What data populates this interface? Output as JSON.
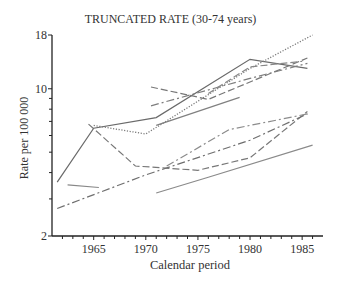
{
  "chart_data": {
    "type": "line",
    "title": "TRUNCATED RATE (30-74 years)",
    "xlabel": "Calendar period",
    "ylabel": "Rate per 100 000",
    "yscale": "log",
    "ylim": [
      2,
      18
    ],
    "xlim": [
      1961,
      1987
    ],
    "y_tick_labels": [
      "2",
      "10",
      "18"
    ],
    "y_minor_ticks": [
      3,
      4,
      5,
      6,
      7,
      8,
      9
    ],
    "x_tick_labels": [
      "1965",
      "1970",
      "1975",
      "1980",
      "1985"
    ],
    "grid": false,
    "legend": null,
    "series": [
      {
        "name": "solid-dark",
        "style": "solid",
        "x": [
          1961.5,
          1965,
          1971,
          1980,
          1985.5
        ],
        "y": [
          3.6,
          6.5,
          7.3,
          13.8,
          12.5
        ]
      },
      {
        "name": "dotted",
        "style": "dotted",
        "x": [
          1965,
          1970,
          1980,
          1986
        ],
        "y": [
          6.7,
          6.1,
          12.5,
          18.0
        ]
      },
      {
        "name": "long-dash",
        "style": "dashed",
        "x": [
          1964.5,
          1969,
          1975,
          1980,
          1985.5
        ],
        "y": [
          6.8,
          4.3,
          4.1,
          4.7,
          7.8
        ]
      },
      {
        "name": "dash-dot-lower",
        "style": "dashdot",
        "x": [
          1961.5,
          1970,
          1980,
          1985.5
        ],
        "y": [
          2.7,
          3.9,
          5.7,
          7.6
        ]
      },
      {
        "name": "solid-short-1962",
        "style": "solid",
        "x": [
          1962.5,
          1965.5
        ],
        "y": [
          3.5,
          3.4
        ]
      },
      {
        "name": "solid-lower-right",
        "style": "solid",
        "x": [
          1971,
          1976,
          1986
        ],
        "y": [
          3.2,
          3.8,
          5.4
        ]
      },
      {
        "name": "dash-dot-mid",
        "style": "dashdot",
        "x": [
          1972,
          1978,
          1985.5
        ],
        "y": [
          4.3,
          6.4,
          7.6
        ]
      },
      {
        "name": "dashed-upper-right",
        "style": "dashed",
        "x": [
          1970.5,
          1976,
          1985.5
        ],
        "y": [
          10.2,
          8.9,
          14.0
        ]
      },
      {
        "name": "long-dash-dot-upper",
        "style": "dashdot",
        "x": [
          1970.5,
          1980,
          1985.5
        ],
        "y": [
          8.3,
          11.2,
          13.2
        ]
      },
      {
        "name": "solid-upper-mid",
        "style": "solid",
        "x": [
          1971,
          1979
        ],
        "y": [
          6.7,
          9.1
        ]
      },
      {
        "name": "dash-long-right",
        "style": "dashed",
        "x": [
          1976,
          1980,
          1985
        ],
        "y": [
          9.5,
          12.7,
          13.5
        ]
      }
    ]
  }
}
